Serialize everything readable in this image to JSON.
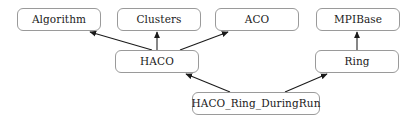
{
  "diagram": {
    "type": "class-inheritance-diagram",
    "canvas": {
      "width": 413,
      "height": 122
    },
    "background_color": "#ffffff",
    "box_fill_color": "#ffffff",
    "box_border_color": "#9a9a9a",
    "edge_color": "#1a1a1a",
    "text_color": "#1a1a1a",
    "nodes": [
      {
        "id": "algorithm",
        "label": "Algorithm",
        "x": 17,
        "y": 8,
        "width": 84,
        "height": 23
      },
      {
        "id": "clusters",
        "label": "Clusters",
        "x": 117,
        "y": 8,
        "width": 84,
        "height": 23
      },
      {
        "id": "aco",
        "label": "ACO",
        "x": 215,
        "y": 8,
        "width": 84,
        "height": 23
      },
      {
        "id": "mpibase",
        "label": "MPIBase",
        "x": 316,
        "y": 8,
        "width": 84,
        "height": 23
      },
      {
        "id": "haco",
        "label": "HACO",
        "x": 115,
        "y": 50,
        "width": 84,
        "height": 23
      },
      {
        "id": "ring",
        "label": "Ring",
        "x": 315,
        "y": 50,
        "width": 84,
        "height": 23
      },
      {
        "id": "haco_ring_duringrun",
        "label": "HACO_Ring_DuringRun",
        "x": 192,
        "y": 92,
        "width": 128,
        "height": 23
      }
    ],
    "edges": [
      {
        "id": "haco-to-algorithm",
        "from": "haco",
        "to": "algorithm",
        "kind": "inheritance",
        "x1": 152,
        "y1": 50,
        "x2": 90,
        "y2": 32
      },
      {
        "id": "haco-to-clusters",
        "from": "haco",
        "to": "clusters",
        "kind": "inheritance",
        "x1": 157,
        "y1": 50,
        "x2": 157,
        "y2": 32
      },
      {
        "id": "haco-to-aco",
        "from": "haco",
        "to": "aco",
        "kind": "inheritance",
        "x1": 180,
        "y1": 50,
        "x2": 228,
        "y2": 32
      },
      {
        "id": "ring-to-mpibase",
        "from": "ring",
        "to": "mpibase",
        "kind": "inheritance",
        "x1": 357,
        "y1": 50,
        "x2": 357,
        "y2": 32
      },
      {
        "id": "duringrun-to-haco",
        "from": "haco_ring_duringrun",
        "to": "haco",
        "kind": "inheritance",
        "x1": 230,
        "y1": 92,
        "x2": 186,
        "y2": 74
      },
      {
        "id": "duringrun-to-ring",
        "from": "haco_ring_duringrun",
        "to": "ring",
        "kind": "inheritance",
        "x1": 285,
        "y1": 92,
        "x2": 327,
        "y2": 74
      }
    ]
  }
}
